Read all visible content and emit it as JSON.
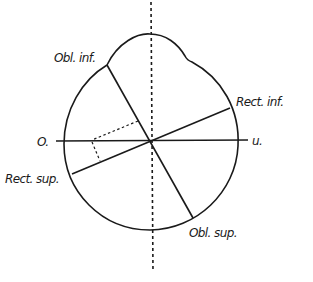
{
  "diagram": {
    "type": "eye-muscle-axes",
    "labels": {
      "obl_inf": "Obl. inf.",
      "rect_inf": "Rect. inf.",
      "o": "O.",
      "u": "u.",
      "rect_sup": "Rect. sup.",
      "obl_sup": "Obl. sup."
    },
    "colors": {
      "line": "#1a1a1a",
      "background": "#ffffff"
    }
  }
}
